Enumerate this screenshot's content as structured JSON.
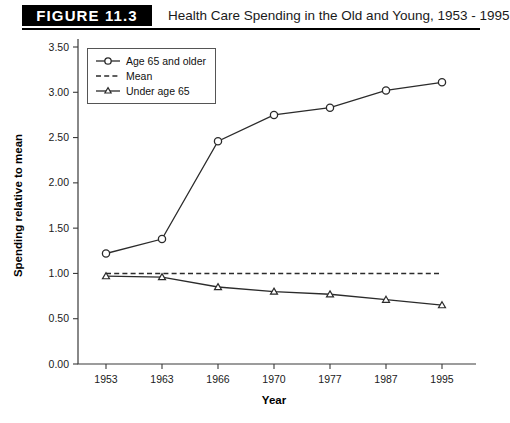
{
  "figure": {
    "badge": "FIGURE 11.3",
    "title": "Health Care Spending in the Old and Young, 1953 - 1995"
  },
  "chart_data": {
    "type": "line",
    "title": "Health Care Spending in the Old and Young, 1953 - 1995",
    "xlabel": "Year",
    "ylabel": "Spending relative to mean",
    "categories": [
      "1953",
      "1963",
      "1966",
      "1970",
      "1977",
      "1987",
      "1995"
    ],
    "ylim": [
      0.0,
      3.5
    ],
    "yticks": [
      "0.00",
      "0.50",
      "1.00",
      "1.50",
      "2.00",
      "2.50",
      "3.00",
      "3.50"
    ],
    "ytick_values": [
      0.0,
      0.5,
      1.0,
      1.5,
      2.0,
      2.5,
      3.0,
      3.5
    ],
    "grid": false,
    "legend_position": "top-left",
    "series": [
      {
        "name": "Age 65 and older",
        "marker": "circle",
        "style": "solid",
        "values": [
          1.22,
          1.38,
          2.46,
          2.75,
          2.83,
          3.02,
          3.11
        ]
      },
      {
        "name": "Mean",
        "marker": "none",
        "style": "dashed",
        "values": [
          1.0,
          1.0,
          1.0,
          1.0,
          1.0,
          1.0,
          1.0
        ]
      },
      {
        "name": "Under age 65",
        "marker": "triangle",
        "style": "solid",
        "values": [
          0.97,
          0.96,
          0.85,
          0.8,
          0.77,
          0.71,
          0.65
        ]
      }
    ]
  },
  "legend": {
    "items": [
      {
        "label": "Age 65 and older"
      },
      {
        "label": "Mean"
      },
      {
        "label": "Under age 65"
      }
    ]
  }
}
